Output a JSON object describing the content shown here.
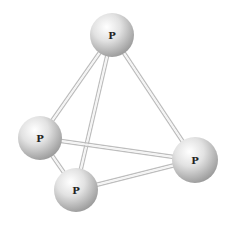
{
  "diagram": {
    "atoms": [
      {
        "id": "top",
        "label": "P",
        "x": 112,
        "y": 35,
        "r": 22
      },
      {
        "id": "left",
        "label": "P",
        "x": 40,
        "y": 138,
        "r": 22
      },
      {
        "id": "right",
        "label": "P",
        "x": 195,
        "y": 160,
        "r": 23
      },
      {
        "id": "bottom",
        "label": "P",
        "x": 76,
        "y": 190,
        "r": 22
      }
    ],
    "bonds": [
      [
        "top",
        "left"
      ],
      [
        "top",
        "bottom"
      ],
      [
        "top",
        "right"
      ],
      [
        "left",
        "right"
      ],
      [
        "left",
        "bottom"
      ],
      [
        "bottom",
        "right"
      ]
    ],
    "colors": {
      "sphere_highlight": "#ffffff",
      "sphere_mid": "#dcdcdc",
      "sphere_shadow": "#9a9a9a",
      "bond": "#c8c8c8"
    }
  }
}
